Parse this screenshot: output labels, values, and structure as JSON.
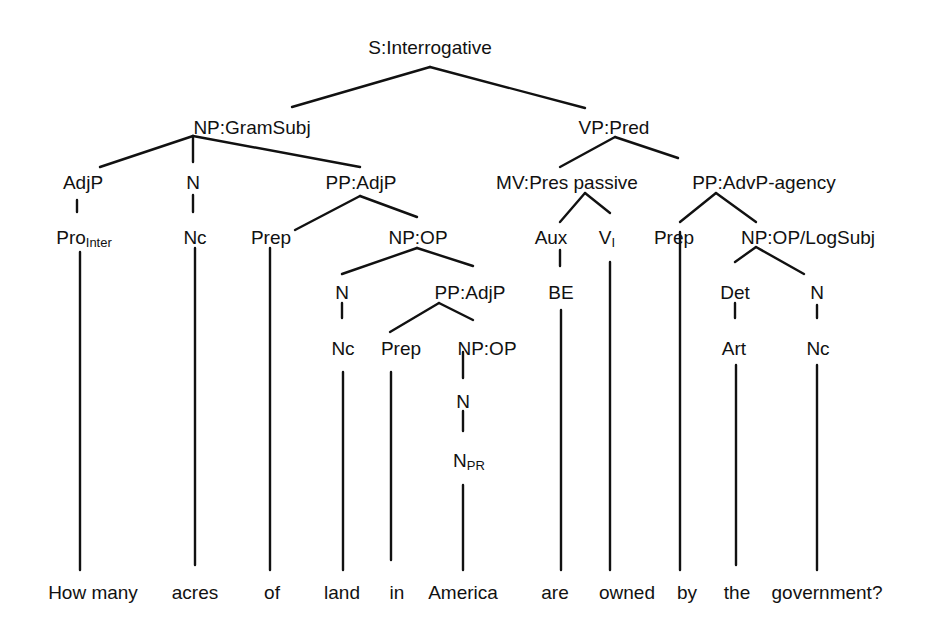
{
  "diagram": {
    "type": "syntax-tree",
    "sentence": "How many acres of land in America are owned by the government?",
    "nodes": {
      "root": "S:Interrogative",
      "np_gramsubj": "NP:GramSubj",
      "vp_pred": "VP:Pred",
      "adjp": "AdjP",
      "n1": "N",
      "pp_adjp1": "PP:AdjP",
      "mv": "MV:Pres passive",
      "pp_advp": "PP:AdvP-agency",
      "pro": "Pro",
      "pro_sub": "Inter",
      "nc1": "Nc",
      "prep1": "Prep",
      "np_op1": "NP:OP",
      "aux": "Aux",
      "v": "V",
      "v_sub": "I",
      "prep3": "Prep",
      "np_op_logsubj": "NP:OP/LogSubj",
      "n2": "N",
      "pp_adjp2": "PP:AdjP",
      "be": "BE",
      "det": "Det",
      "n4": "N",
      "nc2": "Nc",
      "prep2": "Prep",
      "np_op2": "NP:OP",
      "art": "Art",
      "nc3": "Nc",
      "n3": "N",
      "npr": "N",
      "npr_sub": "PR"
    },
    "words": [
      "How many",
      "acres",
      "of",
      "land",
      "in",
      "America",
      "are",
      "owned",
      "by",
      "the",
      "government?"
    ]
  }
}
